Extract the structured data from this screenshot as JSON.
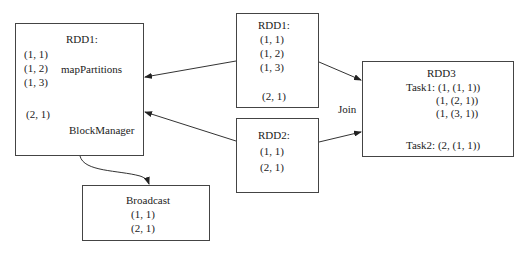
{
  "nodes": {
    "rdd1_main": {
      "title": "RDD1:",
      "items": [
        "(1, 1)",
        "(1, 2)",
        "(1, 3)",
        "(2, 1)"
      ],
      "op_label": "mapPartitions",
      "component_label": "BlockManager"
    },
    "rdd1_src": {
      "title": "RDD1:",
      "items": [
        "(1, 1)",
        "(1, 2)",
        "(1, 3)",
        "(2, 1)"
      ]
    },
    "rdd2": {
      "title": "RDD2:",
      "items": [
        "(1, 1)",
        "(2, 1)"
      ]
    },
    "rdd3": {
      "title": "RDD3",
      "task1_label": "Task1: (1, (1, 1))",
      "task1_items": [
        "(1, (2, 1))",
        "(1, (3, 1))"
      ],
      "task2_label": "Task2: (2, (1, 1))"
    },
    "broadcast": {
      "title": "Broadcast",
      "items": [
        "(1, 1)",
        "(2, 1)"
      ]
    }
  },
  "edges": {
    "join_label": "Join"
  }
}
